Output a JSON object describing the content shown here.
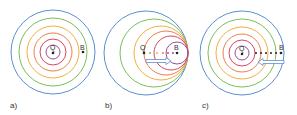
{
  "figure": {
    "colors": {
      "blue": "#5b8fd0",
      "green": "#7cbf5a",
      "yellow_orange": "#f0b040",
      "orange": "#ef7d45",
      "red": "#d9475f",
      "purple": "#9b4f96",
      "point": "#222222",
      "arrow_outline": "#5b8fd0"
    },
    "panels": [
      {
        "label": "a)",
        "source_label": "Q",
        "observer_label": "B",
        "scenario": "stationary source and observer",
        "wavefronts": "concentric circles"
      },
      {
        "label": "b)",
        "source_label": "Q",
        "observer_label": "B",
        "scenario": "source moving toward observer",
        "wavefronts": "circles crowded on observer side",
        "arrow_direction": "right"
      },
      {
        "label": "c)",
        "source_label": "Q",
        "observer_label": "B",
        "scenario": "observer moving toward source",
        "wavefronts": "concentric circles",
        "arrow_direction": "left"
      }
    ]
  }
}
